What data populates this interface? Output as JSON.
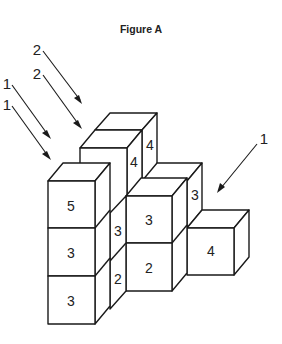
{
  "figure": {
    "title": "Figure A",
    "colors": {
      "stroke": "#1a1a1a",
      "face": "#ffffff",
      "text": "#222222"
    },
    "arrow_labels": {
      "left_top": "2",
      "left_second": "2",
      "left_third": "1",
      "left_fourth": "1",
      "right": "1"
    },
    "cube_faces": {
      "left_tower_top": "5",
      "left_tower_mid": "3",
      "left_tower_bottom": "3",
      "back_tower_side_front": "4",
      "back_tower_side_back": "4",
      "mid_gap_side_upper": "3",
      "mid_gap_side_lower": "2",
      "middle_front_upper": "3",
      "middle_front_lower": "2",
      "middle_side_upper": "3",
      "right_front": "4"
    }
  }
}
